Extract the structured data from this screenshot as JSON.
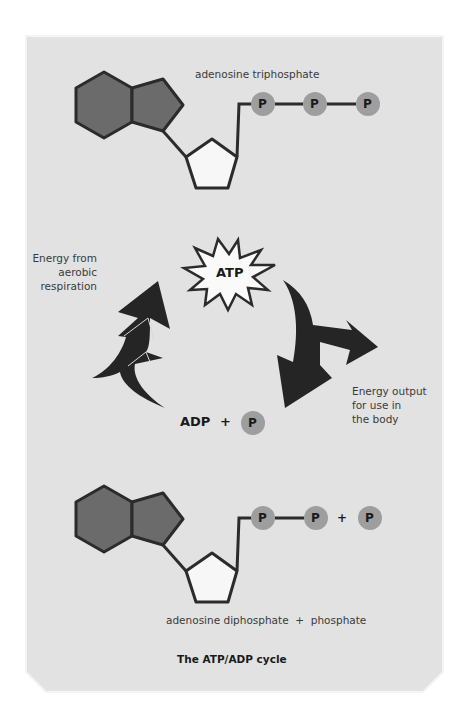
{
  "diagram": {
    "title": "The ATP/ADP cycle",
    "top_molecule": {
      "label": "adenosine triphosphate",
      "phosphates": [
        "P",
        "P",
        "P"
      ]
    },
    "cycle": {
      "center_label": "ATP",
      "input_label_lines": [
        "Energy from",
        "aerobic",
        "respiration"
      ],
      "output_label_lines": [
        "Energy output",
        "for use in",
        "the body"
      ],
      "adp_label": "ADP",
      "plus": "+",
      "phosphate": "P"
    },
    "bottom_molecule": {
      "label": "adenosine diphosphate  +  phosphate",
      "phosphates": [
        "P",
        "P"
      ],
      "plus": "+",
      "free_phosphate": "P"
    },
    "colors": {
      "panel_bg": "#e2e2e2",
      "base_fill": "#6b6b6b",
      "sugar_fill": "#f7f7f7",
      "outline": "#2b2b2b",
      "phosphate_fill": "#9e9e9e",
      "arrow_fill": "#252525",
      "star_fill": "#fafafa"
    }
  }
}
